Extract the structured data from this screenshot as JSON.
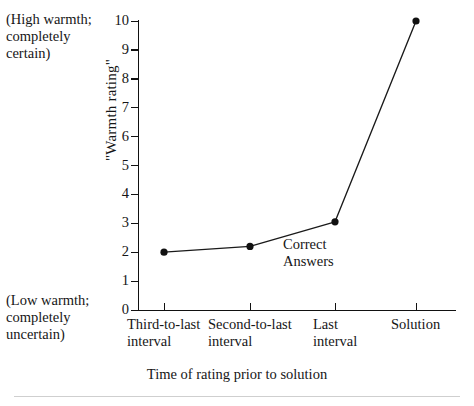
{
  "chart_data": {
    "type": "line",
    "title": "",
    "subtitle": "",
    "xlabel": "Time of rating prior to solution",
    "ylabel": "\"Warmth rating\"",
    "categories": [
      "Third-to-last\ninterval",
      "Second-to-last\ninterval",
      "Last\ninterval",
      "Solution"
    ],
    "series": [
      {
        "name": "Correct Answers",
        "values": [
          2.0,
          2.2,
          3.05,
          10.0
        ]
      }
    ],
    "values": [
      2.0,
      2.2,
      3.05,
      10.0
    ],
    "ylim": [
      0,
      10
    ],
    "yticks": [
      0,
      1,
      2,
      3,
      4,
      5,
      6,
      7,
      8,
      9,
      10
    ],
    "ytick_labels": [
      "0",
      "1",
      "2",
      "3",
      "4",
      "5",
      "6",
      "7",
      "8",
      "9",
      "10"
    ],
    "grid": false,
    "legend_position": "none",
    "annotations": [
      {
        "name": "series-annotation",
        "text": "Correct\nAnswers"
      },
      {
        "name": "high-anchor-note",
        "text": "(High warmth;\n completely\n certain)"
      },
      {
        "name": "low-anchor-note",
        "text": "(Low warmth;\n completely\n uncertain)"
      }
    ],
    "marker": "filled-circle",
    "line_color": "#1a1a1a",
    "marker_color": "#111111",
    "background_color": "#ffffff"
  },
  "axes": {
    "y_axis_title": "\"Warmth rating\"",
    "x_axis_title": "Time of rating prior to solution",
    "y_tick_labels": [
      "10",
      "9",
      "8",
      "7",
      "6",
      "5",
      "4",
      "3",
      "2",
      "1",
      "0"
    ],
    "x_category_labels": [
      "Third-to-last\ninterval",
      "Second-to-last\ninterval",
      "Last\ninterval",
      "Solution"
    ]
  },
  "notes": {
    "high_anchor": "(High warmth;\n completely\n certain)",
    "low_anchor": "(Low warmth;\n completely\n uncertain)",
    "series_label": "Correct\nAnswers"
  }
}
